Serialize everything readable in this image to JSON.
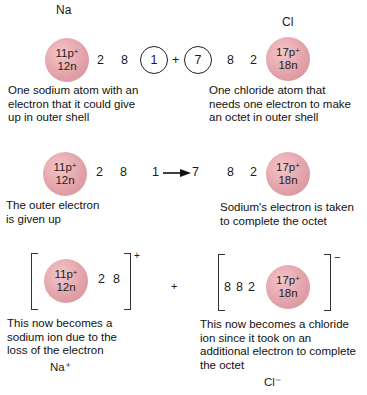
{
  "row1": {
    "na_symbol": "Na",
    "cl_symbol": "Cl",
    "na_nucleus": {
      "protons": "11p",
      "charge_sup": "+",
      "neutrons": "12n"
    },
    "cl_nucleus": {
      "protons": "17p",
      "charge_sup": "+",
      "neutrons": "18n"
    },
    "na_shells": [
      "2",
      "8"
    ],
    "na_outer": "1",
    "plus": "+",
    "cl_outer": "7",
    "cl_shells": [
      "8",
      "2"
    ],
    "na_caption": [
      "One sodium atom with an",
      "electron that it could give",
      "up in outer shell"
    ],
    "cl_caption": [
      "One chloride atom that",
      "needs one electron to make",
      "an octet in outer shell"
    ]
  },
  "row2": {
    "na_nucleus": {
      "protons": "11p",
      "charge_sup": "+",
      "neutrons": "12n"
    },
    "cl_nucleus": {
      "protons": "17p",
      "charge_sup": "+",
      "neutrons": "18n"
    },
    "na_shells": [
      "2",
      "8"
    ],
    "transfer_from": "1",
    "transfer_to": "7",
    "cl_shells": [
      "8",
      "2"
    ],
    "na_caption": [
      "The outer electron",
      "is given up"
    ],
    "cl_caption": [
      "Sodium's electron is taken",
      "to complete the octet"
    ]
  },
  "row3": {
    "na_nucleus": {
      "protons": "11p",
      "charge_sup": "+",
      "neutrons": "12n"
    },
    "cl_nucleus": {
      "protons": "17p",
      "charge_sup": "+",
      "neutrons": "18n"
    },
    "na_shells": [
      "2",
      "8"
    ],
    "na_charge": "+",
    "plus": "+",
    "cl_shells": [
      "8",
      "8",
      "2"
    ],
    "cl_charge": "−",
    "na_caption": [
      "This now becomes a",
      "sodium ion due to the",
      "loss of the electron"
    ],
    "cl_caption": [
      "This now becomes a chloride",
      "ion since it took on an",
      "additional electron to complete",
      "the octet"
    ],
    "na_ion": "Na⁺",
    "cl_ion": "Cl⁻"
  },
  "colors": {
    "nucleus": "#e3a3aa",
    "text": "#1a1a1a",
    "background": "#ffffff"
  }
}
